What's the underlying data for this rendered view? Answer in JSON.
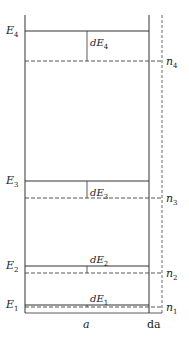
{
  "diagram": {
    "levels": [
      {
        "energy_label": "E",
        "energy_sub": "4",
        "delta_label": "dE",
        "delta_sub": "4",
        "n_label": "n",
        "n_sub": "4"
      },
      {
        "energy_label": "E",
        "energy_sub": "3",
        "delta_label": "dE",
        "delta_sub": "3",
        "n_label": "n",
        "n_sub": "3"
      },
      {
        "energy_label": "E",
        "energy_sub": "2",
        "delta_label": "dE",
        "delta_sub": "2",
        "n_label": "n",
        "n_sub": "2"
      },
      {
        "energy_label": "E",
        "energy_sub": "1",
        "delta_label": "dE",
        "delta_sub": "1",
        "n_label": "n",
        "n_sub": "1"
      }
    ],
    "width_label": "a",
    "dwidth_label": "da",
    "line_color": "#333333"
  }
}
